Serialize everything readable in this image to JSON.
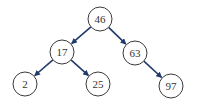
{
  "diagram": {
    "type": "binary-search-tree",
    "colors": {
      "edge": "#1f3a6b",
      "node_stroke": "#3a3a3a",
      "text": "#333333",
      "background": "#ffffff"
    },
    "nodes": [
      {
        "id": "n46",
        "label": "46",
        "x": 100,
        "y": 19
      },
      {
        "id": "n17",
        "label": "17",
        "x": 62,
        "y": 52
      },
      {
        "id": "n63",
        "label": "63",
        "x": 135,
        "y": 53
      },
      {
        "id": "n2",
        "label": "2",
        "x": 25,
        "y": 84
      },
      {
        "id": "n25",
        "label": "25",
        "x": 98,
        "y": 84
      },
      {
        "id": "n97",
        "label": "97",
        "x": 171,
        "y": 86
      }
    ],
    "edges": [
      {
        "from": "46",
        "to": "17"
      },
      {
        "from": "46",
        "to": "63"
      },
      {
        "from": "17",
        "to": "2"
      },
      {
        "from": "17",
        "to": "25"
      },
      {
        "from": "63",
        "to": "97"
      }
    ]
  }
}
